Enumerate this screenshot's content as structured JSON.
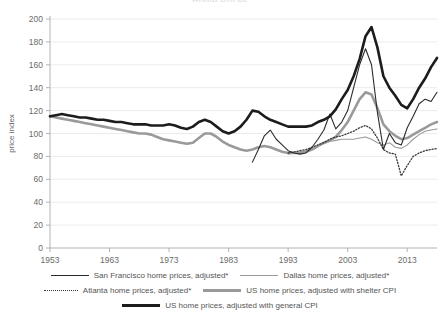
{
  "chart_title": "Home Prices",
  "axis": {
    "ylabel": "price index",
    "yticks": [
      0,
      20,
      40,
      60,
      80,
      100,
      120,
      140,
      160,
      180,
      200
    ],
    "xticks": [
      1953,
      1963,
      1973,
      1983,
      1993,
      2003,
      2013
    ]
  },
  "legend": {
    "sf": "San Francisco home prices, adjusted*",
    "dallas": "Dallas home prices, adjusted*",
    "atlanta": "Atlanta home prices, adjusted*",
    "shelter": "US home prices, adjusted with shelter CPI",
    "general": "US home prices, adjusted with general CPI"
  },
  "colors": {
    "sf": "#2b2b2b",
    "dallas": "#9a9a9a",
    "atlanta": "#3a3a3a",
    "shelter": "#9a9a9a",
    "general": "#1c1c1c",
    "grid": "#e2e2e2",
    "axis": "#aaaaaa",
    "text": "#6b6b6b"
  },
  "chart_data": {
    "type": "line",
    "title": "Home Prices",
    "xlabel": "",
    "ylabel": "price index",
    "xlim": [
      1953,
      2018
    ],
    "ylim": [
      0,
      200
    ],
    "grid": true,
    "legend_position": "bottom",
    "xticks": [
      1953,
      1963,
      1973,
      1983,
      1993,
      2003,
      2013
    ],
    "yticks": [
      0,
      20,
      40,
      60,
      80,
      100,
      120,
      140,
      160,
      180,
      200
    ],
    "series": [
      {
        "name": "US home prices, adjusted with general CPI",
        "color": "#1c1c1c",
        "style": "solid",
        "width": 2.6,
        "x": [
          1953,
          1954,
          1955,
          1956,
          1957,
          1958,
          1959,
          1960,
          1961,
          1962,
          1963,
          1964,
          1965,
          1966,
          1967,
          1968,
          1969,
          1970,
          1971,
          1972,
          1973,
          1974,
          1975,
          1976,
          1977,
          1978,
          1979,
          1980,
          1981,
          1982,
          1983,
          1984,
          1985,
          1986,
          1987,
          1988,
          1989,
          1990,
          1991,
          1992,
          1993,
          1994,
          1995,
          1996,
          1997,
          1998,
          1999,
          2000,
          2001,
          2002,
          2003,
          2004,
          2005,
          2006,
          2007,
          2008,
          2009,
          2010,
          2011,
          2012,
          2013,
          2014,
          2015,
          2016,
          2017,
          2018
        ],
        "y": [
          115,
          116,
          117,
          116,
          115,
          114,
          114,
          113,
          112,
          112,
          111,
          110,
          110,
          109,
          108,
          108,
          108,
          107,
          107,
          107,
          108,
          107,
          105,
          104,
          106,
          110,
          112,
          110,
          106,
          102,
          100,
          102,
          106,
          112,
          120,
          119,
          115,
          112,
          110,
          108,
          106,
          106,
          106,
          106,
          107,
          110,
          112,
          115,
          121,
          130,
          138,
          150,
          165,
          185,
          193,
          175,
          150,
          140,
          133,
          125,
          122,
          130,
          140,
          148,
          158,
          166
        ]
      },
      {
        "name": "US home prices, adjusted with shelter CPI",
        "color": "#9a9a9a",
        "style": "solid",
        "width": 2.6,
        "x": [
          1953,
          1954,
          1955,
          1956,
          1957,
          1958,
          1959,
          1960,
          1961,
          1962,
          1963,
          1964,
          1965,
          1966,
          1967,
          1968,
          1969,
          1970,
          1971,
          1972,
          1973,
          1974,
          1975,
          1976,
          1977,
          1978,
          1979,
          1980,
          1981,
          1982,
          1983,
          1984,
          1985,
          1986,
          1987,
          1988,
          1989,
          1990,
          1991,
          1992,
          1993,
          1994,
          1995,
          1996,
          1997,
          1998,
          1999,
          2000,
          2001,
          2002,
          2003,
          2004,
          2005,
          2006,
          2007,
          2008,
          2009,
          2010,
          2011,
          2012,
          2013,
          2014,
          2015,
          2016,
          2017,
          2018
        ],
        "y": [
          115,
          114,
          113,
          112,
          111,
          110,
          109,
          108,
          107,
          106,
          105,
          104,
          103,
          102,
          101,
          100,
          100,
          99,
          97,
          95,
          94,
          93,
          92,
          91,
          92,
          96,
          100,
          100,
          97,
          93,
          90,
          88,
          86,
          85,
          86,
          88,
          89,
          88,
          86,
          84,
          83,
          83,
          83,
          84,
          86,
          89,
          92,
          94,
          97,
          103,
          110,
          120,
          130,
          136,
          134,
          122,
          108,
          102,
          98,
          95,
          96,
          99,
          102,
          105,
          108,
          110
        ]
      },
      {
        "name": "San Francisco home prices, adjusted*",
        "color": "#2b2b2b",
        "style": "solid",
        "width": 1.1,
        "x": [
          1987,
          1988,
          1989,
          1990,
          1991,
          1992,
          1993,
          1994,
          1995,
          1996,
          1997,
          1998,
          1999,
          2000,
          2001,
          2002,
          2003,
          2004,
          2005,
          2006,
          2007,
          2008,
          2009,
          2010,
          2011,
          2012,
          2013,
          2014,
          2015,
          2016,
          2017,
          2018
        ],
        "y": [
          75,
          86,
          98,
          103,
          95,
          90,
          85,
          83,
          82,
          83,
          88,
          95,
          103,
          117,
          104,
          110,
          120,
          140,
          160,
          174,
          160,
          118,
          86,
          100,
          92,
          90,
          105,
          115,
          126,
          130,
          128,
          136
        ]
      },
      {
        "name": "Dallas home prices, adjusted*",
        "color": "#9a9a9a",
        "style": "solid",
        "width": 1.1,
        "x": [
          1993,
          1994,
          1995,
          1996,
          1997,
          1998,
          1999,
          2000,
          2001,
          2002,
          2003,
          2004,
          2005,
          2006,
          2007,
          2008,
          2009,
          2010,
          2011,
          2012,
          2013,
          2014,
          2015,
          2016,
          2017,
          2018
        ],
        "y": [
          82,
          83,
          84,
          85,
          87,
          89,
          91,
          93,
          94,
          95,
          95,
          95,
          96,
          97,
          95,
          92,
          90,
          92,
          88,
          87,
          90,
          95,
          99,
          102,
          103,
          104
        ]
      },
      {
        "name": "Atlanta home prices, adjusted*",
        "color": "#3a3a3a",
        "style": "dotted",
        "width": 1.3,
        "x": [
          1993,
          1994,
          1995,
          1996,
          1997,
          1998,
          1999,
          2000,
          2001,
          2002,
          2003,
          2004,
          2005,
          2006,
          2007,
          2008,
          2009,
          2010,
          2011,
          2012,
          2013,
          2014,
          2015,
          2016,
          2017,
          2018
        ],
        "y": [
          83,
          84,
          85,
          86,
          88,
          90,
          92,
          95,
          97,
          98,
          100,
          102,
          105,
          107,
          104,
          96,
          86,
          83,
          82,
          63,
          72,
          80,
          83,
          85,
          86,
          87
        ]
      }
    ]
  }
}
